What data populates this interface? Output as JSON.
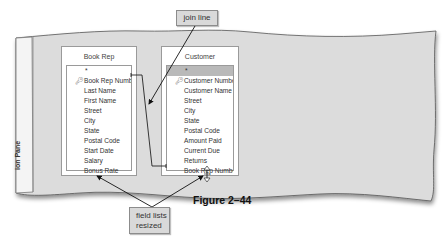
{
  "navigation_pane": {
    "label": "ion Pane"
  },
  "field_lists": [
    {
      "title": "Book Rep",
      "fields": [
        {
          "label": "*",
          "type": "all"
        },
        {
          "label": "Book Rep Number",
          "type": "key"
        },
        {
          "label": "Last Name"
        },
        {
          "label": "First Name"
        },
        {
          "label": "Street"
        },
        {
          "label": "City"
        },
        {
          "label": "State"
        },
        {
          "label": "Postal Code"
        },
        {
          "label": "Start Date"
        },
        {
          "label": "Salary"
        },
        {
          "label": "Bonus Rate"
        }
      ]
    },
    {
      "title": "Customer",
      "fields": [
        {
          "label": "*",
          "type": "all",
          "selected": true
        },
        {
          "label": "Customer Number",
          "type": "key"
        },
        {
          "label": "Customer Name"
        },
        {
          "label": "Street"
        },
        {
          "label": "City"
        },
        {
          "label": "State"
        },
        {
          "label": "Postal Code"
        },
        {
          "label": "Amount Paid"
        },
        {
          "label": "Current Due"
        },
        {
          "label": "Returns"
        },
        {
          "label": "Book Rep Number"
        }
      ]
    }
  ],
  "callouts": {
    "join_line": "join line",
    "field_lists_resized_line1": "field lists",
    "field_lists_resized_line2": "resized"
  },
  "figure_caption": "Figure 2–44",
  "icons": {
    "primary_key": "key-icon",
    "resize_cursor": "vertical-resize-cursor-icon"
  },
  "colors": {
    "canvas_gray": "#dcdcdc",
    "callout_fill": "#d9d9d9",
    "selected_row": "#b9b9b9"
  }
}
